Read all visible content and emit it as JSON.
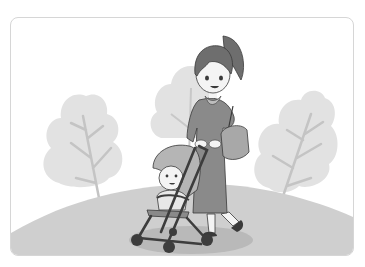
{
  "illustration": {
    "caption": "Mother pushing a baby in a stroller through a park",
    "style": "grayscale clip-art",
    "elements": [
      "left-tree",
      "center-tree",
      "right-tree",
      "hill",
      "mother",
      "shoulder-bag",
      "stroller",
      "baby",
      "shadow"
    ],
    "colors": {
      "background": "#ffffff",
      "frame_border": "#d6d6d6",
      "tree_foliage": "#e2e2e2",
      "tree_trunk": "#c4c4c4",
      "hill": "#cfcfcf",
      "shadow": "#b9b9b9",
      "dress": "#8a8a8a",
      "hair": "#6e6e6e",
      "skin": "#f4f4f4",
      "outline": "#3a3a3a",
      "stroller_canopy": "#b5b5b5",
      "stroller_frame": "#3d3d3d",
      "bag": "#a8a8a8"
    }
  }
}
